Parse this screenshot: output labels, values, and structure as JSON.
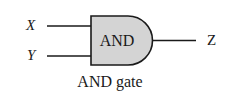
{
  "diagram": {
    "type": "logic-gate",
    "gate": {
      "kind": "AND",
      "label": "AND",
      "fill_color": "#d4d4d4",
      "stroke_color": "#1a1a1a"
    },
    "inputs": [
      {
        "name": "X"
      },
      {
        "name": "Y"
      }
    ],
    "output": {
      "name": "Z"
    },
    "caption": "AND gate"
  }
}
